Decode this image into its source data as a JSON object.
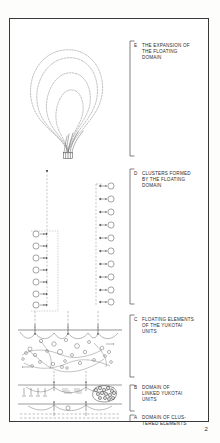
{
  "page": {
    "number": "2",
    "background_color": "#fdfdfc",
    "ink_color": "#2a2a2a"
  },
  "figure": {
    "title": "",
    "zones": [
      {
        "id": "E",
        "letter": "E",
        "label": "THE EXPANSION OF\nTHE FLOATING\nDOMAIN",
        "description": "nested dashed teardrop contours expanding upward from a narrow neck",
        "bracket_top": 22,
        "bracket_bottom": 137
      },
      {
        "id": "D",
        "letter": "D",
        "label": "CLUSTERS FORMED\nBY THE FLOATING\nDOMAIN",
        "description": "two dashed vertical columns strung with small open circles joined by short arrows",
        "bracket_top": 150,
        "bracket_bottom": 285
      },
      {
        "id": "C",
        "letter": "C",
        "label": "FLOATING ELEMENTS\nOF THE YUKOTAI\nUNITS",
        "description": "scattered field of small open circles with curved linking paths beneath an arrowed horizontal line",
        "bracket_top": 296,
        "bracket_bottom": 358
      },
      {
        "id": "B",
        "letter": "B",
        "label": "DOMAIN OF\nLINKED YUKOTAI\nUNITS",
        "description": "horizontal banded layer with upward arrows and a dense dark packed cluster at right",
        "bracket_top": 366,
        "bracket_bottom": 392
      },
      {
        "id": "A",
        "letter": "A",
        "label": "DOMAIN OF CLUS-\nTERED ELEMENTS",
        "description": "lowest dashed baseline band of clustered elements",
        "bracket_top": 396,
        "bracket_bottom": 416
      }
    ]
  }
}
